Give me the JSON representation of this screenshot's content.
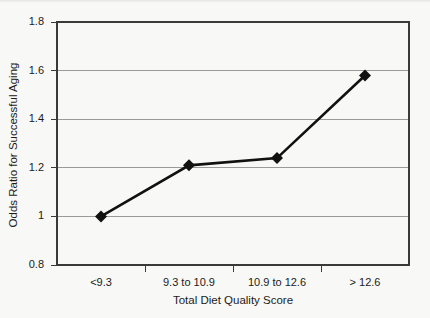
{
  "chart_data": {
    "type": "line",
    "title": "",
    "xlabel": "Total Diet Quality Score",
    "ylabel": "Odds Ratio for Successful Aging",
    "categories": [
      "<9.3",
      "9.3 to 10.9",
      "10.9 to 12.6",
      "> 12.6"
    ],
    "values": [
      1.0,
      1.21,
      1.24,
      1.58
    ],
    "ylim": [
      0.8,
      1.8
    ],
    "ytick_values": [
      1.8,
      1.6,
      1.4,
      1.2,
      1,
      0.8
    ],
    "ytick_labels": [
      "1.8",
      "1.6",
      "1.4",
      "1.2",
      "1",
      "0.8"
    ],
    "grid": true,
    "legend": "none",
    "marker": "diamond",
    "series": [
      {
        "name": "Odds Ratio for Successful Aging",
        "values": [
          1.0,
          1.21,
          1.24,
          1.58
        ]
      }
    ],
    "colors": {
      "line": "#111111",
      "marker": "#111111",
      "grid": "#9a9a9a",
      "frame": "#3a3a3a",
      "background": "#f8f8f6",
      "text": "#1b1b1b"
    }
  }
}
